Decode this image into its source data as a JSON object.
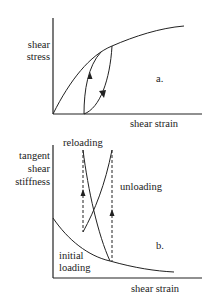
{
  "panel_a": {
    "y_label_line1": "shear",
    "y_label_line2": "stress",
    "x_label": "shear strain",
    "tag": "a."
  },
  "panel_b": {
    "y_label_line1": "tangent",
    "y_label_line2": "shear",
    "y_label_line3": "stiffness",
    "x_label": "shear strain",
    "tag": "b.",
    "curve_labels": {
      "reloading": "reloading",
      "unloading": "unloading",
      "initial_line1": "initial",
      "initial_line2": "loading"
    }
  },
  "colors": {
    "line": "#222222",
    "background": "#ffffff"
  }
}
